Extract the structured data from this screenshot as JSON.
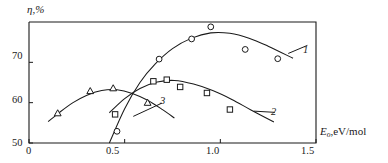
{
  "figure": {
    "axes": {
      "y_title": "η,%",
      "x_title_symbol": "E",
      "x_title_subscript": "o",
      "x_title_rest": ",eV/mol",
      "x_ticks": [
        "0",
        "0.5",
        "1.0",
        "1.5"
      ],
      "y_ticks": [
        "50",
        "60",
        "70"
      ]
    },
    "curve_labels": {
      "one": "1",
      "two": "2",
      "three": "3"
    }
  },
  "chart_data": {
    "type": "scatter",
    "title": "",
    "xlabel": "Eo, eV/mol",
    "ylabel": "η,%",
    "xlim": [
      0,
      1.5
    ],
    "ylim": [
      50,
      80
    ],
    "xticks": [
      0,
      0.5,
      1.0,
      1.5
    ],
    "yticks": [
      50,
      60,
      70
    ],
    "grid": false,
    "legend": "inline curve numbers 1, 2, 3",
    "series": [
      {
        "name": "1",
        "marker": "circle",
        "label_position": {
          "x": 1.47,
          "y": 73.5
        },
        "points": [
          {
            "x": 0.46,
            "y": 52.9
          },
          {
            "x": 0.68,
            "y": 70.8
          },
          {
            "x": 0.85,
            "y": 75.8
          },
          {
            "x": 0.95,
            "y": 78.8
          },
          {
            "x": 1.13,
            "y": 73.2
          },
          {
            "x": 1.3,
            "y": 70.9
          }
        ],
        "fit": [
          {
            "x": 0.42,
            "y": 50.0
          },
          {
            "x": 0.5,
            "y": 58.5
          },
          {
            "x": 0.58,
            "y": 65.0
          },
          {
            "x": 0.66,
            "y": 69.6
          },
          {
            "x": 0.75,
            "y": 73.4
          },
          {
            "x": 0.85,
            "y": 76.0
          },
          {
            "x": 0.95,
            "y": 77.3
          },
          {
            "x": 1.05,
            "y": 77.2
          },
          {
            "x": 1.15,
            "y": 76.0
          },
          {
            "x": 1.25,
            "y": 74.0
          },
          {
            "x": 1.38,
            "y": 71.0
          }
        ]
      },
      {
        "name": "2",
        "marker": "square",
        "label_position": {
          "x": 1.29,
          "y": 57.0
        },
        "points": [
          {
            "x": 0.45,
            "y": 57.1
          },
          {
            "x": 0.65,
            "y": 65.3
          },
          {
            "x": 0.72,
            "y": 65.7
          },
          {
            "x": 0.79,
            "y": 63.9
          },
          {
            "x": 0.93,
            "y": 62.4
          },
          {
            "x": 1.05,
            "y": 58.3
          }
        ],
        "fit": [
          {
            "x": 0.42,
            "y": 57.5
          },
          {
            "x": 0.5,
            "y": 61.0
          },
          {
            "x": 0.58,
            "y": 63.5
          },
          {
            "x": 0.67,
            "y": 65.1
          },
          {
            "x": 0.76,
            "y": 65.5
          },
          {
            "x": 0.86,
            "y": 64.6
          },
          {
            "x": 0.96,
            "y": 63.0
          },
          {
            "x": 1.06,
            "y": 60.8
          },
          {
            "x": 1.16,
            "y": 58.2
          },
          {
            "x": 1.28,
            "y": 55.2
          }
        ]
      },
      {
        "name": "3",
        "marker": "triangle",
        "label_position": {
          "x": 0.7,
          "y": 59.5
        },
        "points": [
          {
            "x": 0.15,
            "y": 57.4
          },
          {
            "x": 0.32,
            "y": 62.9
          },
          {
            "x": 0.44,
            "y": 63.6
          },
          {
            "x": 0.62,
            "y": 60.0
          }
        ],
        "fit": [
          {
            "x": 0.1,
            "y": 55.3
          },
          {
            "x": 0.16,
            "y": 57.6
          },
          {
            "x": 0.23,
            "y": 60.0
          },
          {
            "x": 0.3,
            "y": 61.8
          },
          {
            "x": 0.38,
            "y": 63.0
          },
          {
            "x": 0.46,
            "y": 63.2
          },
          {
            "x": 0.54,
            "y": 62.3
          },
          {
            "x": 0.62,
            "y": 60.6
          },
          {
            "x": 0.7,
            "y": 58.2
          },
          {
            "x": 0.76,
            "y": 56.2
          }
        ]
      }
    ]
  }
}
